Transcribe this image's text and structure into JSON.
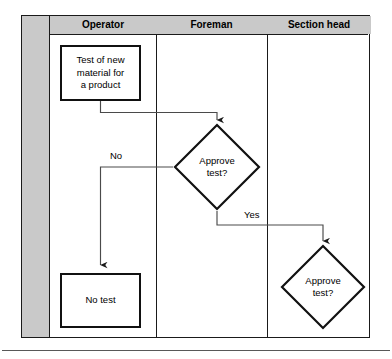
{
  "diagram": {
    "type": "swimlane-flowchart",
    "lanes": [
      {
        "id": "spine",
        "label": "",
        "x": 0,
        "width": 28,
        "header": false
      },
      {
        "id": "operator",
        "label": "Operator",
        "x": 28,
        "width": 106,
        "header": true
      },
      {
        "id": "foreman",
        "label": "Foreman",
        "x": 134,
        "width": 111,
        "header": true
      },
      {
        "id": "section-head",
        "label": "Section head",
        "x": 245,
        "width": 104,
        "header": true
      }
    ],
    "nodes": [
      {
        "id": "test-new-material",
        "shape": "process",
        "lane": "operator",
        "text": "Test of new\nmaterial for\na product",
        "x": 38,
        "y": 29,
        "width": 81,
        "height": 56
      },
      {
        "id": "approve-test-foreman",
        "shape": "decision",
        "lane": "foreman",
        "text": "Approve\ntest?",
        "x": 151,
        "y": 107,
        "width": 88,
        "height": 88
      },
      {
        "id": "no-test",
        "shape": "process",
        "lane": "operator",
        "text": "No test",
        "x": 38,
        "y": 257,
        "width": 81,
        "height": 55
      },
      {
        "id": "approve-test-section-head",
        "shape": "decision",
        "lane": "section-head",
        "text": "Approve\ntest?",
        "x": 258,
        "y": 228,
        "width": 86,
        "height": 86
      }
    ],
    "edges": [
      {
        "id": "edge-start-to-decision1",
        "from": "test-new-material",
        "to": "approve-test-foreman",
        "label": "",
        "arrow": "down"
      },
      {
        "id": "edge-decision1-no",
        "from": "approve-test-foreman",
        "to": "no-test",
        "label": "No",
        "arrow": "down"
      },
      {
        "id": "edge-decision1-yes",
        "from": "approve-test-foreman",
        "to": "approve-test-section-head",
        "label": "Yes",
        "arrow": "down"
      }
    ],
    "edge_labels": {
      "no": "No",
      "yes": "Yes"
    },
    "colors": {
      "lane_header_fill": "#c9c9c9",
      "spine_fill": "#c9c9c9",
      "canvas": "#ffffff",
      "stroke": "#1a1a1a",
      "node_stroke": "#111111",
      "connector_stroke": "#4a4a4a",
      "text": "#000000",
      "bottom_rule": "#585858"
    }
  }
}
